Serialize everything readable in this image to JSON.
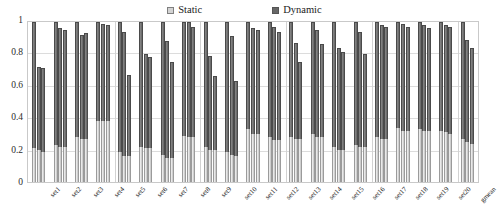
{
  "chart_data": {
    "type": "bar",
    "subtype": "stacked-grouped",
    "title": "",
    "xlabel": "",
    "ylabel": "",
    "ylim": [
      0,
      1
    ],
    "yticks": [
      "0",
      "0.2",
      "0.4",
      "0.6",
      "0.8",
      "1"
    ],
    "ytick_values": [
      0,
      0.2,
      0.4,
      0.6,
      0.8,
      1.0
    ],
    "grid": true,
    "legend_position": "top-center",
    "legend": [
      "Static",
      "Dynamic"
    ],
    "colors": {
      "static": "#cfcfcf",
      "dynamic": "#6e6e6e",
      "grid": "#dcdcdc",
      "frame": "#c9c9c9",
      "text": "#232323"
    },
    "bars_per_group": 3,
    "categories": [
      "set1",
      "set2",
      "set3",
      "set4",
      "set5",
      "set6",
      "set7",
      "set8",
      "set9",
      "set10",
      "set11",
      "set12",
      "set13",
      "set14",
      "set15",
      "set16",
      "set17",
      "set18",
      "set19",
      "set20",
      "gmean"
    ],
    "series": [
      {
        "name": "Static",
        "values": [
          [
            0.21,
            0.2,
            0.19
          ],
          [
            0.23,
            0.22,
            0.22
          ],
          [
            0.28,
            0.27,
            0.27
          ],
          [
            0.38,
            0.38,
            0.38
          ],
          [
            0.19,
            0.16,
            0.16
          ],
          [
            0.22,
            0.21,
            0.21
          ],
          [
            0.17,
            0.15,
            0.15
          ],
          [
            0.29,
            0.28,
            0.28
          ],
          [
            0.22,
            0.2,
            0.2
          ],
          [
            0.19,
            0.17,
            0.16
          ],
          [
            0.33,
            0.3,
            0.3
          ],
          [
            0.28,
            0.26,
            0.26
          ],
          [
            0.28,
            0.27,
            0.27
          ],
          [
            0.3,
            0.28,
            0.28
          ],
          [
            0.22,
            0.2,
            0.2
          ],
          [
            0.23,
            0.22,
            0.22
          ],
          [
            0.28,
            0.27,
            0.27
          ],
          [
            0.34,
            0.32,
            0.32
          ],
          [
            0.33,
            0.32,
            0.32
          ],
          [
            0.32,
            0.31,
            0.3
          ],
          [
            0.27,
            0.25,
            0.24
          ]
        ]
      },
      {
        "name": "Dynamic",
        "values": [
          [
            0.79,
            0.52,
            0.52
          ],
          [
            0.77,
            0.74,
            0.73
          ],
          [
            0.72,
            0.65,
            0.66
          ],
          [
            0.62,
            0.61,
            0.6
          ],
          [
            0.81,
            0.78,
            0.51
          ],
          [
            0.78,
            0.59,
            0.57
          ],
          [
            0.83,
            0.73,
            0.6
          ],
          [
            0.71,
            0.72,
            0.69
          ],
          [
            0.78,
            0.59,
            0.46
          ],
          [
            0.81,
            0.74,
            0.47
          ],
          [
            0.67,
            0.66,
            0.65
          ],
          [
            0.72,
            0.71,
            0.68
          ],
          [
            0.72,
            0.6,
            0.48
          ],
          [
            0.7,
            0.67,
            0.58
          ],
          [
            0.78,
            0.64,
            0.61
          ],
          [
            0.77,
            0.72,
            0.58
          ],
          [
            0.72,
            0.71,
            0.7
          ],
          [
            0.66,
            0.67,
            0.65
          ],
          [
            0.67,
            0.66,
            0.64
          ],
          [
            0.68,
            0.67,
            0.67
          ],
          [
            0.73,
            0.64,
            0.6
          ]
        ]
      }
    ],
    "totals": [
      [
        1.0,
        0.72,
        0.71
      ],
      [
        1.0,
        0.96,
        0.95
      ],
      [
        1.0,
        0.92,
        0.93
      ],
      [
        1.0,
        0.99,
        0.98
      ],
      [
        1.0,
        0.94,
        0.67
      ],
      [
        1.0,
        0.8,
        0.78
      ],
      [
        1.0,
        0.88,
        0.75
      ],
      [
        1.0,
        1.0,
        0.97
      ],
      [
        1.0,
        0.79,
        0.66
      ],
      [
        1.0,
        0.91,
        0.63
      ],
      [
        1.0,
        0.96,
        0.95
      ],
      [
        1.0,
        0.97,
        0.94
      ],
      [
        1.0,
        0.87,
        0.75
      ],
      [
        1.0,
        0.95,
        0.86
      ],
      [
        1.0,
        0.84,
        0.81
      ],
      [
        1.0,
        0.94,
        0.8
      ],
      [
        1.0,
        0.98,
        0.97
      ],
      [
        1.0,
        0.99,
        0.97
      ],
      [
        1.0,
        0.98,
        0.96
      ],
      [
        1.0,
        0.98,
        0.97
      ],
      [
        1.0,
        0.89,
        0.84
      ]
    ],
    "group_dividers_after": [
      4,
      8,
      12,
      16,
      20
    ]
  }
}
